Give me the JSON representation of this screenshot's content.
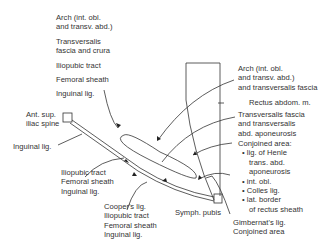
{
  "diagram": {
    "left_labels": {
      "top_group": [
        [
          "Arch (int. obl.",
          "and transv. abd.)"
        ],
        [
          "Transversalis",
          "fascia and crura"
        ],
        [
          "Iliopubic tract"
        ],
        [
          "Femoral sheath"
        ],
        [
          "Inguinal lig."
        ]
      ],
      "asis": [
        "Ant. sup.",
        "iliac spine"
      ],
      "inguinal": "Inguinal lig.",
      "mid_group": [
        "Iliopubic tract",
        "Femoral sheath",
        "Inguinal lig."
      ],
      "low_group": [
        "Cooper's lig.",
        "Iliopubic tract",
        "Femoral sheath",
        "Inguinal lig."
      ]
    },
    "right_labels": {
      "arch": [
        "Arch (int. obl.",
        "and transv. abd.)",
        "and transversalis fascia"
      ],
      "rectus": "Rectus abdom. m.",
      "transversalis": [
        "Transversalis fascia",
        "and transversalis",
        "abd. aponeurosis"
      ],
      "conjoined_title": "Conjoined area:",
      "conjoined_items": [
        [
          "lig. of Henle",
          "trans. abd.",
          "aponeurosis"
        ],
        [
          "int. obl."
        ],
        [
          "Colles lig."
        ],
        [
          "lat. border",
          "of rectus sheath"
        ]
      ],
      "symph": "Symph. pubis",
      "gimbernat": [
        "Gimbernat's lig.",
        "Conjoined area"
      ]
    }
  }
}
